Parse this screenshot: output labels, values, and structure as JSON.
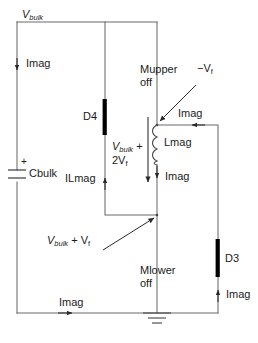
{
  "diagram": {
    "type": "circuit-schematic",
    "background_color": "#ffffff",
    "line_color": "#6b6b6b",
    "text_color": "#1a1a1a",
    "component_color": "#000000"
  },
  "labels": {
    "vbulk_top": "V",
    "vbulk_top_sub": "bulk",
    "imag_left": "Imag",
    "cbulk": "Cbulk",
    "cbulk_polarity": "+",
    "d4": "D4",
    "ilmag": "ILmag",
    "vbulk_plus_2vf_line1_v": "V",
    "vbulk_plus_2vf_line1_sub": "bulk",
    "vbulk_plus_2vf_line1_tail": " +",
    "vbulk_plus_2vf_line2": "2V",
    "vbulk_plus_2vf_line2_sub": "f",
    "mupper_line1": "Mupper",
    "mupper_line2": "off",
    "minus_vf": "−V",
    "minus_vf_sub": "f",
    "imag_top_right": "Imag",
    "lmag": "Lmag",
    "imag_lmag": "Imag",
    "vbulk_plus_vf_v": "V",
    "vbulk_plus_vf_sub": "bulk",
    "vbulk_plus_vf_tail": " + V",
    "vbulk_plus_vf_tail_sub": "f",
    "mlower_line1": "Mlower",
    "mlower_line2": "off",
    "d3": "D3",
    "imag_d3": "Imag",
    "imag_bottom": "Imag"
  },
  "components": [
    {
      "name": "Cbulk",
      "type": "capacitor",
      "label": "Cbulk"
    },
    {
      "name": "D4",
      "type": "diode",
      "label": "D4"
    },
    {
      "name": "D3",
      "type": "diode",
      "label": "D3"
    },
    {
      "name": "Lmag",
      "type": "inductor",
      "label": "Lmag"
    },
    {
      "name": "Mupper",
      "type": "mosfet",
      "label": "Mupper",
      "state": "off"
    },
    {
      "name": "Mlower",
      "type": "mosfet",
      "label": "Mlower",
      "state": "off"
    },
    {
      "name": "GND",
      "type": "ground",
      "label": ""
    }
  ],
  "currents": [
    {
      "name": "Imag",
      "location": "left-rail",
      "direction": "down"
    },
    {
      "name": "ILmag",
      "location": "d4-branch",
      "direction": "up"
    },
    {
      "name": "Imag",
      "location": "top-right-wire",
      "direction": "left"
    },
    {
      "name": "Imag",
      "location": "lmag-branch",
      "direction": "down"
    },
    {
      "name": "Imag",
      "location": "d3-branch",
      "direction": "up"
    },
    {
      "name": "Imag",
      "location": "bottom-rail",
      "direction": "right"
    }
  ],
  "voltages": [
    {
      "name": "Vbulk",
      "location": "top-left-node"
    },
    {
      "name": "Vbulk + 2Vf",
      "location": "d4-to-center"
    },
    {
      "name": "Vbulk + Vf",
      "location": "center-mid-node"
    },
    {
      "name": "-Vf",
      "location": "mupper-drain-node"
    }
  ]
}
